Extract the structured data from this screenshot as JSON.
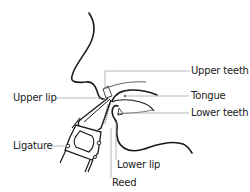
{
  "diagram": {
    "labels": {
      "upper_teeth": "Upper teeth",
      "upper_lip": "Upper lip",
      "tongue": "Tongue",
      "lower_teeth": "Lower teeth",
      "ligature": "Ligature",
      "lower_lip": "Lower lip",
      "reed": "Reed"
    },
    "colors": {
      "outline": "#1a1a1a",
      "leader_line": "#9a9a9a",
      "text": "#222222",
      "background": "#ffffff"
    }
  }
}
